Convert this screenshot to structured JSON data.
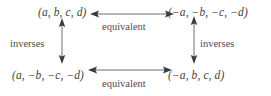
{
  "diagram": {
    "type": "commutative-square",
    "background_color": "#ffffff",
    "text_color": "#3f3f42",
    "arrow_color": "#5c5c5f",
    "nodes": {
      "top_left": "(a, b, c, d)",
      "top_right": "(−a, −b, −c, −d)",
      "bottom_left": "(a, −b, −c, −d)",
      "bottom_right": "(−a, b, c, d)"
    },
    "edges": {
      "top_horizontal": {
        "label": "equivalent",
        "style": "double-headed",
        "orientation": "horizontal"
      },
      "bottom_horizontal": {
        "label": "equivalent",
        "style": "double-headed",
        "orientation": "horizontal"
      },
      "left_vertical": {
        "label": "inverses",
        "style": "double-headed",
        "orientation": "vertical"
      },
      "right_vertical": {
        "label": "inverses",
        "style": "double-headed",
        "orientation": "vertical"
      }
    },
    "icons": {
      "double-arrow-horizontal": "⟷",
      "double-arrow-vertical": "↕"
    }
  }
}
